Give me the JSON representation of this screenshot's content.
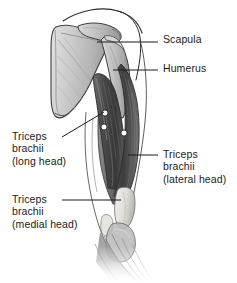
{
  "figure": {
    "background_color": "#ffffff",
    "width": 237,
    "height": 283
  },
  "palette": {
    "bone_light": "#c9c9c9",
    "bone_mid": "#b0b0b0",
    "bone_shadow": "#8f8f8f",
    "bone_outline": "#3d3d3d",
    "muscle_dark": "#3a3a3a",
    "muscle_mid": "#585858",
    "muscle_light": "#7a7a7a",
    "tendon": "#e8e8e4",
    "skin_outline": "#2a2a2a",
    "leader_line": "#1a1a1a",
    "marker_fill": "#ffffff",
    "marker_stroke": "#2b2b2b",
    "text": "#1a1a1a"
  },
  "labels": [
    {
      "id": "scapula",
      "name": "scapula",
      "lines": [
        "Scapula"
      ],
      "side": "right",
      "text_x": 163,
      "text_y": 33,
      "leader": {
        "x1": 97,
        "y1": 42,
        "x2": 158,
        "y2": 42
      }
    },
    {
      "id": "humerus",
      "name": "humerus",
      "lines": [
        "Humerus"
      ],
      "side": "right",
      "text_x": 163,
      "text_y": 62,
      "leader": {
        "x1": 113,
        "y1": 70,
        "x2": 158,
        "y2": 70
      }
    },
    {
      "id": "triceps-long-head",
      "name": "triceps-brachii-long-head",
      "lines": [
        "Triceps",
        "brachii",
        "(long head)"
      ],
      "side": "left",
      "text_x": 12,
      "text_y": 130,
      "leader": {
        "x1": 62,
        "y1": 137,
        "x2": 104,
        "y2": 112
      }
    },
    {
      "id": "triceps-lateral-head",
      "name": "triceps-brachii-lateral-head",
      "lines": [
        "Triceps",
        "brachii",
        "(lateral head)"
      ],
      "side": "right",
      "text_x": 163,
      "text_y": 148,
      "leader": {
        "x1": 128,
        "y1": 155,
        "x2": 158,
        "y2": 155
      }
    },
    {
      "id": "triceps-medial-head",
      "name": "triceps-brachii-medial-head",
      "lines": [
        "Triceps",
        "brachii",
        "(medial head)"
      ],
      "side": "left",
      "text_x": 12,
      "text_y": 193,
      "leader": {
        "x1": 62,
        "y1": 200,
        "x2": 121,
        "y2": 200
      }
    }
  ],
  "markers": [
    {
      "name": "marker-dot-1",
      "cx": 105,
      "cy": 113,
      "r": 3.1
    },
    {
      "name": "marker-dot-2",
      "cx": 104,
      "cy": 127,
      "r": 3.1
    },
    {
      "name": "marker-dot-3",
      "cx": 124,
      "cy": 133,
      "r": 3.1
    }
  ],
  "structures": [
    {
      "name": "scapula-body",
      "kind": "bone"
    },
    {
      "name": "acromion-process",
      "kind": "bone"
    },
    {
      "name": "humerus-shaft",
      "kind": "bone"
    },
    {
      "name": "triceps-long-head-belly",
      "kind": "muscle"
    },
    {
      "name": "triceps-lateral-head-belly",
      "kind": "muscle"
    },
    {
      "name": "triceps-medial-head-belly",
      "kind": "muscle"
    },
    {
      "name": "triceps-tendon",
      "kind": "tendon"
    },
    {
      "name": "olecranon-elbow",
      "kind": "bone"
    },
    {
      "name": "forearm-mass",
      "kind": "muscle"
    },
    {
      "name": "skin-contour-shoulder",
      "kind": "outline"
    },
    {
      "name": "skin-contour-arm-medial",
      "kind": "outline"
    },
    {
      "name": "skin-contour-arm-lateral",
      "kind": "outline"
    }
  ]
}
